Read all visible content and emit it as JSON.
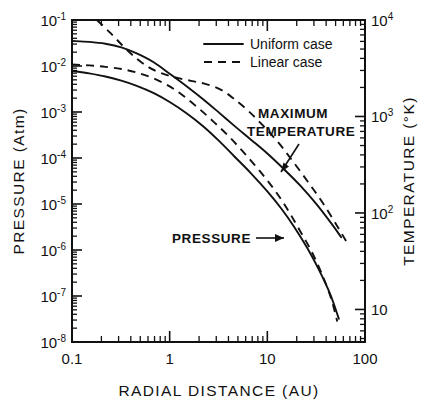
{
  "chart_data": {
    "type": "line",
    "title": "",
    "xlabel": "RADIAL DISTANCE (AU)",
    "ylabel": "PRESSURE (Atm)",
    "y2label": "TEMPERATURE (°K)",
    "xscale": "log",
    "yscale": "log",
    "xlim": [
      0.1,
      100
    ],
    "ylim": [
      1e-08,
      0.1
    ],
    "y2lim": [
      4.6,
      10000
    ],
    "grid": false,
    "xticks": [
      "0.1",
      "1",
      "10",
      "100"
    ],
    "xtick_values": [
      0.1,
      1,
      10,
      100
    ],
    "yticks": [
      {
        "mantissa": "10",
        "exp": "-1"
      },
      {
        "mantissa": "10",
        "exp": "-2"
      },
      {
        "mantissa": "10",
        "exp": "-3"
      },
      {
        "mantissa": "10",
        "exp": "-4"
      },
      {
        "mantissa": "10",
        "exp": "-5"
      },
      {
        "mantissa": "10",
        "exp": "-6"
      },
      {
        "mantissa": "10",
        "exp": "-7"
      },
      {
        "mantissa": "10",
        "exp": "-8"
      }
    ],
    "y2ticks": [
      {
        "mantissa": "10",
        "exp": "4"
      },
      {
        "mantissa": "10",
        "exp": "3"
      },
      {
        "mantissa": "10",
        "exp": "2"
      },
      {
        "mantissa": "10",
        "exp": ""
      }
    ],
    "legend": {
      "position": "top-right-inside",
      "entries": [
        {
          "label": "Uniform case",
          "style": "solid"
        },
        {
          "label": "Linear case",
          "style": "dashed"
        }
      ]
    },
    "annotations": [
      {
        "text": "MAXIMUM",
        "line2": "TEMPERATURE",
        "target": "temperature-curves"
      },
      {
        "text": "PRESSURE",
        "target": "pressure-curves"
      }
    ],
    "series": [
      {
        "name": "Maximum temperature, uniform case",
        "style": "solid",
        "axis": "right",
        "points": [
          [
            0.1,
            0.035
          ],
          [
            0.15,
            0.0335
          ],
          [
            0.22,
            0.0305
          ],
          [
            0.32,
            0.0255
          ],
          [
            0.46,
            0.0188
          ],
          [
            0.68,
            0.0122
          ],
          [
            1.0,
            0.0068
          ],
          [
            1.5,
            0.0036
          ],
          [
            2.2,
            0.0019
          ],
          [
            3.2,
            0.00097
          ],
          [
            4.6,
            0.0005
          ],
          [
            6.8,
            0.00025
          ],
          [
            10.0,
            0.000125
          ],
          [
            15.0,
            5.55e-05
          ],
          [
            22.0,
            2.45e-05
          ],
          [
            32.0,
            9.8e-06
          ],
          [
            46.0,
            3.6e-06
          ],
          [
            57.0,
            1.9e-06
          ]
        ]
      },
      {
        "name": "Maximum temperature, linear case",
        "style": "dashed",
        "axis": "right",
        "points": [
          [
            0.18,
            0.1
          ],
          [
            0.25,
            0.051
          ],
          [
            0.34,
            0.026
          ],
          [
            0.46,
            0.0145
          ],
          [
            0.62,
            0.0092
          ],
          [
            0.85,
            0.0068
          ],
          [
            1.2,
            0.0055
          ],
          [
            1.7,
            0.0047
          ],
          [
            2.4,
            0.004
          ],
          [
            3.4,
            0.003
          ],
          [
            4.6,
            0.0019
          ],
          [
            6.4,
            0.00105
          ],
          [
            9.0,
            0.00051
          ],
          [
            13.0,
            0.000215
          ],
          [
            18.0,
            8.8e-05
          ],
          [
            26.0,
            3.05e-05
          ],
          [
            37.0,
            1.05e-05
          ],
          [
            52.0,
            3.3e-06
          ],
          [
            66.0,
            1.4e-06
          ]
        ]
      },
      {
        "name": "Pressure, uniform case",
        "style": "solid",
        "axis": "left",
        "points": [
          [
            0.1,
            0.0079
          ],
          [
            0.15,
            0.0069
          ],
          [
            0.22,
            0.0059
          ],
          [
            0.32,
            0.0048
          ],
          [
            0.46,
            0.0037
          ],
          [
            0.68,
            0.0026
          ],
          [
            1.0,
            0.00165
          ],
          [
            1.5,
            0.00093
          ],
          [
            2.2,
            0.00049
          ],
          [
            3.2,
            0.000235
          ],
          [
            4.6,
            0.000108
          ],
          [
            6.8,
            4.65e-05
          ],
          [
            10.0,
            1.88e-05
          ],
          [
            14.0,
            7.8e-06
          ],
          [
            19.0,
            3.1e-06
          ],
          [
            26.0,
            1.05e-06
          ],
          [
            34.0,
            3.6e-07
          ],
          [
            44.0,
            1.1e-07
          ],
          [
            54.0,
            3.2e-08
          ]
        ]
      },
      {
        "name": "Pressure, linear case",
        "style": "dashed",
        "axis": "left",
        "points": [
          [
            0.1,
            0.0108
          ],
          [
            0.15,
            0.0103
          ],
          [
            0.22,
            0.0096
          ],
          [
            0.32,
            0.0086
          ],
          [
            0.46,
            0.0072
          ],
          [
            0.68,
            0.0054
          ],
          [
            1.0,
            0.0036
          ],
          [
            1.4,
            0.0022
          ],
          [
            2.0,
            0.00118
          ],
          [
            2.9,
            0.00058
          ],
          [
            4.2,
            0.00027
          ],
          [
            6.0,
            0.000118
          ],
          [
            8.6,
            4.85e-05
          ],
          [
            12.0,
            1.95e-05
          ],
          [
            16.0,
            7.8e-06
          ],
          [
            21.0,
            2.9e-06
          ],
          [
            28.0,
            9.8e-07
          ],
          [
            36.0,
            3.1e-07
          ],
          [
            45.0,
            8.8e-08
          ],
          [
            52.0,
            2.8e-08
          ]
        ]
      }
    ]
  }
}
